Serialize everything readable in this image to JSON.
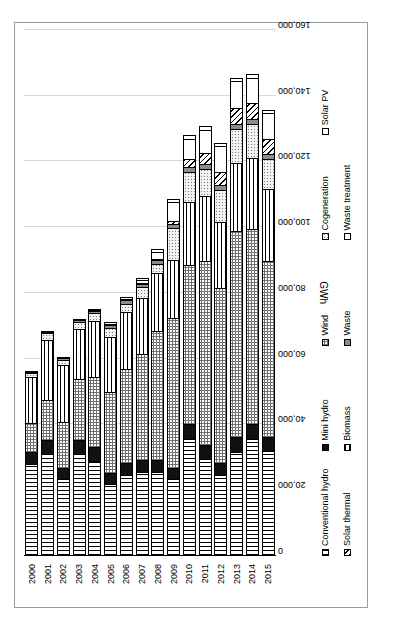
{
  "chart_data": {
    "type": "bar",
    "orientation": "horizontal-stacked",
    "title": "",
    "xlabel": "GWh",
    "ylabel": "",
    "categories": [
      "2000",
      "2001",
      "2002",
      "2003",
      "2004",
      "2005",
      "2006",
      "2007",
      "2008",
      "2009",
      "2010",
      "2011",
      "2012",
      "2013",
      "2014",
      "2015"
    ],
    "xlim": [
      0,
      160000
    ],
    "xticks": [
      "0",
      "20,000",
      "40,000",
      "60,000",
      "80,000",
      "100,000",
      "120,000",
      "140,000",
      "160,000"
    ],
    "xtick_values": [
      0,
      20000,
      40000,
      60000,
      80000,
      100000,
      120000,
      140000,
      160000
    ],
    "grid": true,
    "legend_position": "bottom",
    "series": [
      {
        "name": "Conventional hydro",
        "pattern": "vertical-lines",
        "values": [
          28000,
          31000,
          23500,
          31000,
          29000,
          22000,
          24500,
          25500,
          25500,
          23500,
          35500,
          29500,
          24500,
          31500,
          35500,
          32000
        ]
      },
      {
        "name": "Mini hydro",
        "pattern": "solid-black",
        "values": [
          4000,
          4500,
          3500,
          4500,
          4500,
          3500,
          4000,
          4000,
          4000,
          3500,
          5000,
          4500,
          4000,
          5000,
          5000,
          4500
        ]
      },
      {
        "name": "Wind",
        "pattern": "cross-hatch",
        "values": [
          9000,
          12500,
          14500,
          19000,
          21500,
          25000,
          29000,
          32500,
          39500,
          46000,
          48500,
          56500,
          53500,
          63000,
          59500,
          54000
        ]
      },
      {
        "name": "Biomass",
        "pattern": "horizontal-lines",
        "values": [
          14500,
          18500,
          17500,
          15500,
          17500,
          17000,
          17500,
          17500,
          18000,
          18000,
          19500,
          20000,
          20500,
          21000,
          22000,
          22000
        ]
      },
      {
        "name": "Cogeneration",
        "pattern": "fine-dots",
        "values": [
          1500,
          2500,
          2000,
          2500,
          2500,
          3000,
          3000,
          3500,
          3000,
          10000,
          9500,
          8500,
          10000,
          10500,
          10500,
          9500
        ]
      },
      {
        "name": "Waste",
        "pattern": "solid-grey",
        "values": [
          500,
          700,
          700,
          800,
          1000,
          1200,
          1400,
          1400,
          1500,
          1600,
          2000,
          1800,
          1800,
          2000,
          2000,
          1800
        ]
      },
      {
        "name": "Solar thermal",
        "pattern": "diagonal-lines",
        "values": [
          0,
          0,
          0,
          0,
          0,
          0,
          0,
          200,
          500,
          1200,
          2500,
          3500,
          4500,
          5000,
          5000,
          5000
        ]
      },
      {
        "name": "Solar PV",
        "pattern": "white",
        "values": [
          0,
          0,
          0,
          0,
          200,
          400,
          600,
          1000,
          2500,
          6000,
          6500,
          7500,
          8000,
          8500,
          8000,
          8000
        ]
      },
      {
        "name": "Waste treatment",
        "pattern": "white-outline",
        "values": [
          500,
          600,
          600,
          700,
          800,
          900,
          1000,
          1000,
          1200,
          1300,
          1500,
          1400,
          1400,
          1500,
          1500,
          1400
        ]
      }
    ],
    "legend_rows": [
      [
        "Conventional hydro",
        "Mini hydro",
        "Wind",
        "Cogeneration",
        "Solar PV"
      ],
      [
        "Solar thermal",
        "Biomass",
        "Waste",
        "Waste treatment",
        ""
      ]
    ]
  },
  "legend": {
    "items": [
      {
        "label": "Conventional hydro",
        "swatch": "p-convhydro"
      },
      {
        "label": "Mini hydro",
        "swatch": "p-minihydro"
      },
      {
        "label": "Wind",
        "swatch": "p-wind"
      },
      {
        "label": "Cogeneration",
        "swatch": "p-cogen"
      },
      {
        "label": "Solar PV",
        "swatch": "p-solarpv"
      },
      {
        "label": "Solar thermal",
        "swatch": "p-solarthermal"
      },
      {
        "label": "Biomass",
        "swatch": "p-biomass"
      },
      {
        "label": "Waste",
        "swatch": "p-waste"
      },
      {
        "label": "Waste treatment",
        "swatch": "p-wastetreat"
      }
    ]
  }
}
